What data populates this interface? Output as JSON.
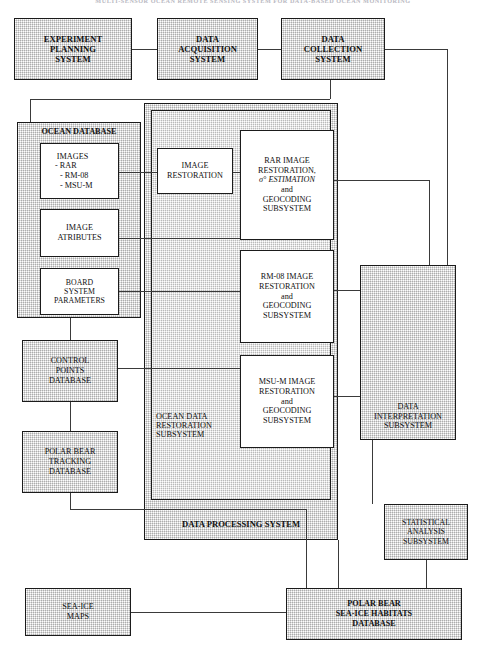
{
  "page": {
    "running_head": "MULTI-SENSOR OCEAN REMOTE SENSING SYSTEM FOR DATA-BASED OCEAN MONITORING",
    "width": 480,
    "height": 666
  },
  "diagram": {
    "type": "block-flow-diagram",
    "colors": {
      "box_border": "#1b1b1b",
      "box_fill_stipple": "#d9d9d9",
      "box_fill_light": "#e4e4e4",
      "box_fill_white": "#ffffff",
      "connector": "#3a3a3a",
      "page_background": "#ffffff"
    }
  },
  "top_row": {
    "experiment_planning": {
      "lines": [
        "EXPERIMENT",
        "PLANNING",
        "SYSTEM"
      ]
    },
    "data_acquisition": {
      "lines": [
        "DATA",
        "ACQUISITION",
        "SYSTEM"
      ]
    },
    "data_collection": {
      "lines": [
        "DATA",
        "COLLECTION",
        "SYSTEM"
      ]
    }
  },
  "ocean_database": {
    "label": "OCEAN DATABASE",
    "items": [
      {
        "lines": [
          "IMAGES",
          "- RAR",
          "- RM-08",
          "- MSU-M"
        ],
        "align": "left-list"
      },
      {
        "lines": [
          "IMAGE",
          "ATRIBUTES"
        ],
        "align": "center"
      },
      {
        "lines": [
          "BOARD",
          "SYSTEM",
          "PARAMETERS"
        ],
        "align": "center"
      }
    ]
  },
  "left_column": {
    "control_points": {
      "lines": [
        "CONTROL",
        "POINTS",
        "DATABASE"
      ]
    },
    "polar_bear_tracking": {
      "lines": [
        "POLAR BEAR",
        "TRACKING",
        "DATABASE"
      ]
    },
    "sea_ice_maps": {
      "lines": [
        "SEA-ICE",
        "MAPS"
      ]
    }
  },
  "data_processing_system": {
    "label": "DATA PROCESSING SYSTEM",
    "ocean_data_restoration": {
      "label_lines": [
        "OCEAN  DATA",
        "RESTORATION",
        "SUBSYSTEM"
      ]
    },
    "image_restoration": {
      "lines": [
        "IMAGE",
        "RESTORATION"
      ]
    },
    "subsystems": [
      {
        "lines": [
          "RAR IMAGE",
          "RESTORATION,",
          "σ° ESTIMATION",
          "and",
          "GEOCODING",
          "SUBSYSTEM"
        ],
        "sigma_line_index": 2
      },
      {
        "lines": [
          "RM-08 IMAGE",
          "RESTORATION",
          "and",
          "GEOCODING",
          "SUBSYSTEM"
        ]
      },
      {
        "lines": [
          "MSU-M IMAGE",
          "RESTORATION",
          "and",
          "GEOCODING",
          "SUBSYSTEM"
        ]
      }
    ]
  },
  "right_column": {
    "data_interpretation": {
      "lines": [
        "DATA",
        "INTERPRETATION",
        "SUBSYSTEM"
      ]
    },
    "statistical_analysis": {
      "lines": [
        "STATISTICAL",
        "ANALYSIS",
        "SUBSYSTEM"
      ]
    }
  },
  "bottom": {
    "polar_bear_habitats": {
      "lines": [
        "POLAR BEAR",
        "SEA-ICE  HABITATS",
        "DATABASE"
      ]
    }
  }
}
